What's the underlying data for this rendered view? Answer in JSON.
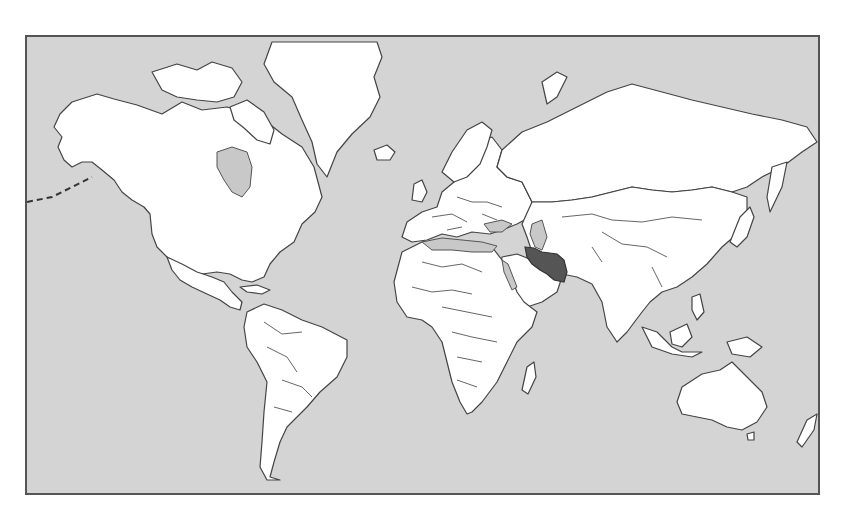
{
  "map": {
    "type": "world-locator-map",
    "projection": "mercator",
    "highlighted_country": "Iran",
    "colors": {
      "ocean": "#d4d4d4",
      "land": "#ffffff",
      "border": "#444444",
      "highlight": "#555555",
      "inland_sea": "#c8c8c8",
      "frame": "#555555"
    },
    "continents": [
      "North America",
      "South America",
      "Europe",
      "Africa",
      "Asia",
      "Australia",
      "Greenland",
      "Antarctica-none"
    ],
    "shaded_water_bodies": [
      "Caspian Sea",
      "Black Sea",
      "Mediterranean Sea",
      "Red Sea",
      "Persian Gulf",
      "Arabian Sea",
      "Bay of Bengal",
      "Hudson Bay",
      "Baltic Sea"
    ]
  }
}
